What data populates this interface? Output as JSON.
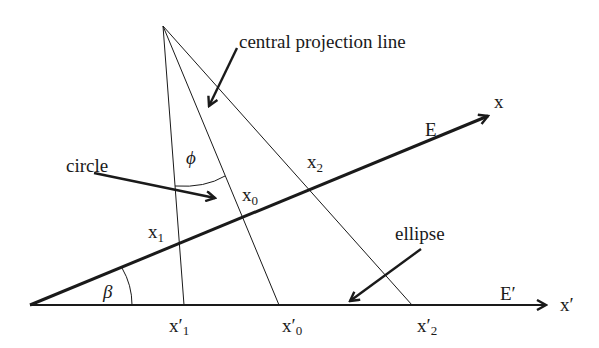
{
  "diagram": {
    "labels": {
      "central_projection_line": "central projection line",
      "circle": "circle",
      "ellipse": "ellipse",
      "x_axis": "x",
      "x_prime_axis": "x′",
      "plane_E": "E",
      "plane_E_prime": "E′",
      "phi": "ϕ",
      "beta": "β",
      "x0": "x",
      "x0_sub": "0",
      "x1": "x",
      "x1_sub": "1",
      "x2": "x",
      "x2_sub": "2",
      "xp0": "x′",
      "xp0_sub": "0",
      "xp1": "x′",
      "xp1_sub": "1",
      "xp2": "x′",
      "xp2_sub": "2"
    },
    "colors": {
      "line": "#1a1a1a",
      "background": "#ffffff"
    }
  }
}
